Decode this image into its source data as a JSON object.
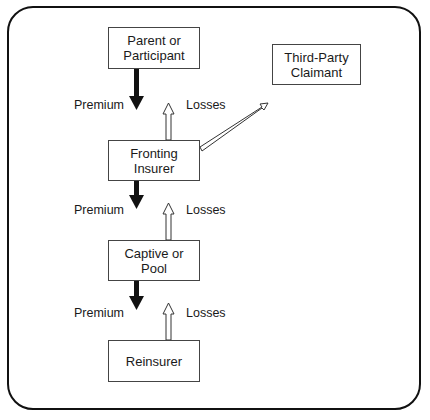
{
  "diagram": {
    "nodes": {
      "parent": {
        "line1": "Parent or",
        "line2": "Participant"
      },
      "third_party": {
        "line1": "Third-Party",
        "line2": "Claimant"
      },
      "fronting": {
        "line1": "Fronting",
        "line2": "Insurer"
      },
      "captive": {
        "line1": "Captive or",
        "line2": "Pool"
      },
      "reinsurer": {
        "line1": "Reinsurer"
      }
    },
    "flows": [
      {
        "premium_label": "Premium",
        "losses_label": "Losses"
      },
      {
        "premium_label": "Premium",
        "losses_label": "Losses"
      },
      {
        "premium_label": "Premium",
        "losses_label": "Losses"
      }
    ],
    "colors": {
      "premium_arrow": "#111111",
      "losses_arrow": "#ffffff",
      "border": "#444444"
    }
  }
}
